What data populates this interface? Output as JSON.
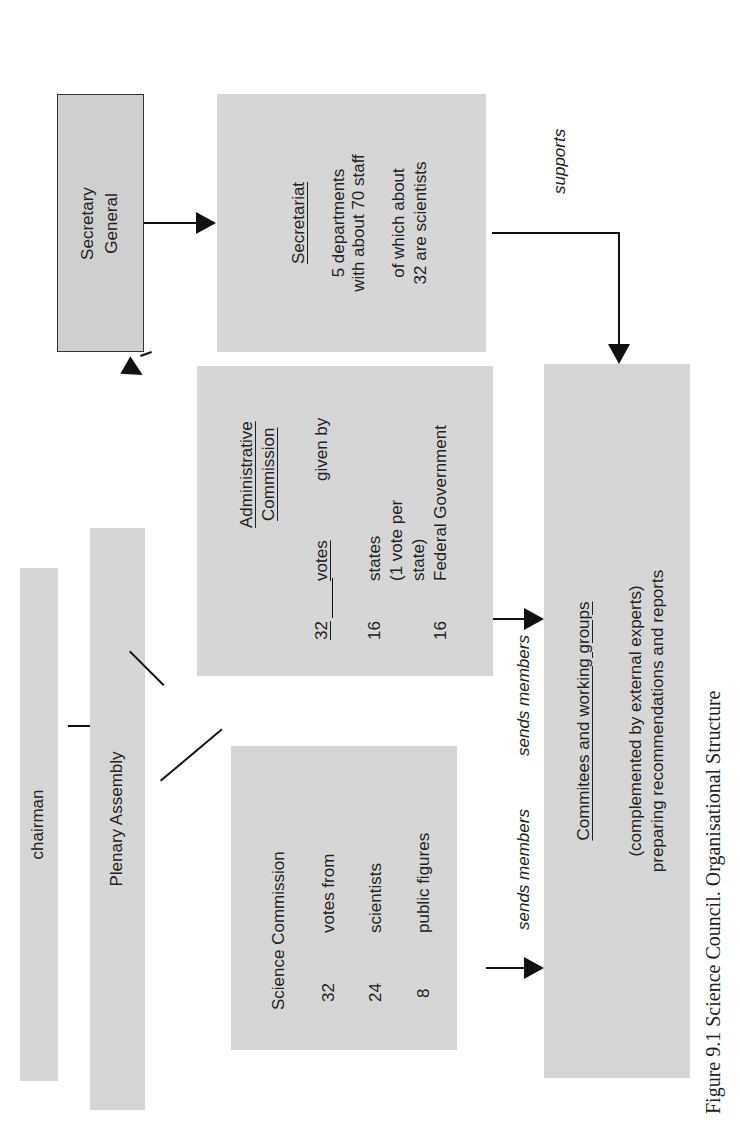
{
  "figure": {
    "caption": "Figure 9.1  Science Council. Organisational Structure",
    "orientation": "rotated 90deg counter-clockwise"
  },
  "nodes": {
    "chairman": {
      "label": "chairman"
    },
    "plenary_assembly": {
      "label": "Plenary Assembly"
    },
    "secretary_general": {
      "label_line1": "Secretary",
      "label_line2": "General"
    },
    "secretariat": {
      "title": "Secretariat",
      "line1": "5 departments",
      "line2": "with about 70 staff",
      "line3": "of which about",
      "line4": "32 are scientists"
    },
    "administrative_commission": {
      "title_line1": "Administrative",
      "title_line2": "Commission",
      "rows": [
        {
          "num": "32",
          "text": "votes",
          "extra": "given by"
        },
        {
          "num": "16",
          "text": "states"
        },
        {
          "num": "",
          "text": "(1 vote per"
        },
        {
          "num": "",
          "text": "state)"
        },
        {
          "num": "16",
          "text": "Federal Government"
        }
      ]
    },
    "science_commission": {
      "title": "Science Commission",
      "rows": [
        {
          "num": "32",
          "text": "votes from"
        },
        {
          "num": "24",
          "text": "scientists"
        },
        {
          "num": "8",
          "text": "public figures"
        }
      ]
    },
    "committees": {
      "title": "Commitees and working groups",
      "line1": "(complemented by external experts)",
      "line2": "preparing recommendations and reports"
    }
  },
  "edges": {
    "supports": "supports",
    "sends_members_science": "sends members",
    "sends_members_admin": "sends members"
  },
  "colors": {
    "box_fill": "#d6d6d6",
    "line": "#111111",
    "background": "#ffffff"
  }
}
